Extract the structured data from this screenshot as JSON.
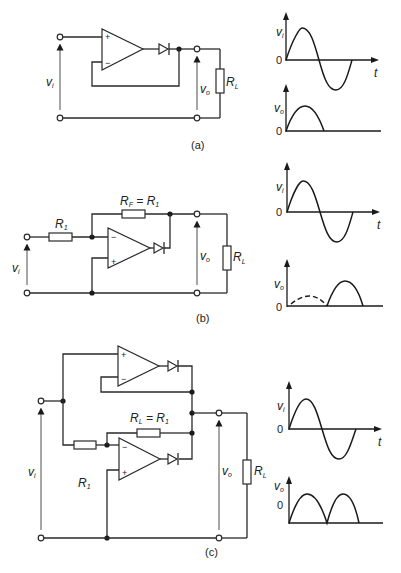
{
  "figure": {
    "panels": [
      {
        "id": "a",
        "caption": "(a)",
        "circuit": {
          "input_label": "v",
          "input_sub": "i",
          "output_label": "v",
          "output_sub": "o",
          "load_label": "R",
          "load_sub": "L",
          "opamp_plus": "+",
          "opamp_minus": "−"
        },
        "waveforms": {
          "input": {
            "label": "v",
            "sub": "i",
            "zero": "0",
            "time": "t"
          },
          "output": {
            "label": "v",
            "sub": "o",
            "zero": "0"
          }
        }
      },
      {
        "id": "b",
        "caption": "(b)",
        "circuit": {
          "input_label": "v",
          "input_sub": "i",
          "output_label": "v",
          "output_sub": "o",
          "load_label": "R",
          "load_sub": "L",
          "r1_label": "R",
          "r1_sub": "1",
          "rf_label": "R",
          "rf_sub": "F",
          "rf_eq": " = R",
          "rf_eq_sub": "1",
          "opamp_plus": "+",
          "opamp_minus": "−"
        },
        "waveforms": {
          "input": {
            "label": "v",
            "sub": "i",
            "zero": "0",
            "time": "t"
          },
          "output": {
            "label": "v",
            "sub": "o",
            "zero": "0"
          }
        }
      },
      {
        "id": "c",
        "caption": "(c)",
        "circuit": {
          "input_label": "v",
          "input_sub": "i",
          "output_label": "v",
          "output_sub": "o",
          "load_label": "R",
          "load_sub": "L",
          "r1_label": "R",
          "r1_sub": "1",
          "rfb_label": "R",
          "rfb_sub": "L",
          "rfb_eq": " = R",
          "rfb_eq_sub": "1",
          "opamp_plus": "+",
          "opamp_minus": "−"
        },
        "waveforms": {
          "input": {
            "label": "v",
            "sub": "i",
            "zero": "0",
            "time": "t"
          },
          "output": {
            "label": "v",
            "sub": "o",
            "zero": "0"
          }
        }
      }
    ]
  },
  "colors": {
    "ink": "#1a1a1a",
    "background": "#ffffff"
  }
}
